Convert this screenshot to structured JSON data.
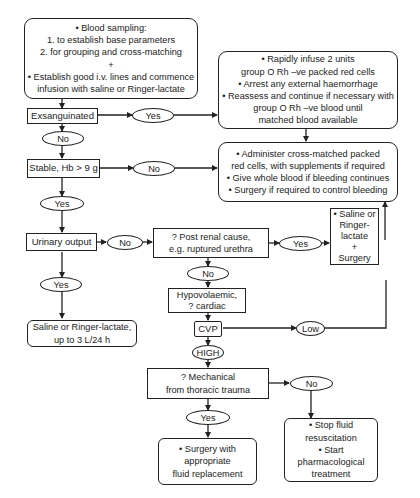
{
  "flowchart": {
    "start_box": {
      "lines": [
        "• Blood sampling:",
        "1. to establish base parameters",
        "2. for grouping and cross-matching",
        "+",
        "• Establish good i.v. lines and commence",
        "infusion with saline or Ringer-lactate"
      ]
    },
    "exsanguinated": "Exsanguinated",
    "exsang_yes": "Yes",
    "exsang_no": "No",
    "rapid_infuse_box": {
      "lines": [
        "• Rapidly infuse 2 units",
        "group O Rh –ve packed red cells",
        "• Arrest any external haemorrhage",
        "• Reassess and continue if necessary with",
        "group O Rh –ve blood until",
        "matched blood available"
      ]
    },
    "stable": "Stable, Hb > 9 g",
    "stable_no": "No",
    "stable_yes": "Yes",
    "administer_box": {
      "lines": [
        "• Administer cross-matched packed",
        "red cells, with supplements if required",
        "• Give whole blood if bleeding continues",
        "• Surgery if required to control bleeding"
      ]
    },
    "urinary_output": "Urinary output",
    "urinary_no": "No",
    "urinary_yes": "Yes",
    "post_renal": {
      "lines": [
        "? Post renal cause,",
        "e.g. ruptured urethra"
      ]
    },
    "post_renal_yes": "Yes",
    "post_renal_no": "No",
    "saline_surgery_box": {
      "lines": [
        "• Saline or",
        "Ringer-",
        "lactate",
        "+",
        "Surgery"
      ]
    },
    "saline_box": {
      "lines": [
        "Saline or Ringer-lactate,",
        "up to 3 L/24 h"
      ]
    },
    "hypovolaemic": {
      "lines": [
        "Hypovolaemic,",
        "? cardiac"
      ]
    },
    "cvp": "CVP",
    "cvp_low": "Low",
    "cvp_high": "HIGH",
    "mechanical": {
      "lines": [
        "? Mechanical",
        "from thoracic trauma"
      ]
    },
    "mechanical_no": "No",
    "mechanical_yes": "Yes",
    "surgery_box": {
      "lines": [
        "• Surgery with",
        "appropriate",
        "fluid replacement"
      ]
    },
    "stop_fluid_box": {
      "lines": [
        "• Stop fluid",
        "resuscitation",
        "• Start",
        "pharmacological",
        "treatment"
      ]
    }
  }
}
